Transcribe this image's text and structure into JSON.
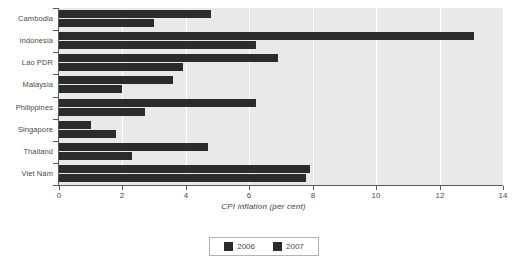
{
  "chart_data": {
    "type": "bar",
    "orientation": "horizontal",
    "title": "",
    "xlabel": "CPI inflation (per cent)",
    "ylabel": "",
    "xlim": [
      0,
      14
    ],
    "xticks": [
      0,
      2,
      4,
      6,
      8,
      10,
      12,
      14
    ],
    "xtick_labels": [
      "0",
      "2",
      "4",
      "6",
      "8",
      "10",
      "12",
      "14"
    ],
    "grid": true,
    "grid_axis": "x",
    "legend_position": "bottom",
    "categories": [
      "Cambodia",
      "Indonesia",
      "Lao PDR",
      "Malaysia",
      "Philippines",
      "Singapore",
      "Thailand",
      "Viet Nam"
    ],
    "series": [
      {
        "name": "2006",
        "color": "#2b2b2b",
        "values": [
          4.8,
          13.1,
          6.9,
          3.6,
          6.2,
          1.0,
          4.7,
          7.9
        ]
      },
      {
        "name": "2007",
        "color": "#2b2b2b",
        "values": [
          3.0,
          6.2,
          3.9,
          2.0,
          2.7,
          1.8,
          2.3,
          7.8
        ]
      }
    ]
  },
  "legend": {
    "entries": [
      {
        "label": "2006",
        "swatch": "legend-swatch-2006"
      },
      {
        "label": "2007",
        "swatch": "legend-swatch-2007"
      }
    ]
  },
  "colors": {
    "bar": "#2b2b2b",
    "plot_background": "#e9e9e9",
    "gridline": "#ffffff",
    "axis": "#5a5a5a",
    "text": "#4a4a4a"
  }
}
